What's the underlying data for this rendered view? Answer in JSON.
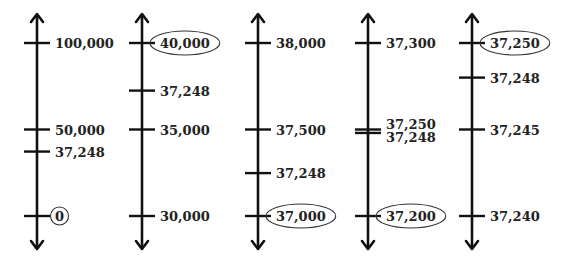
{
  "number_lines": [
    {
      "name": "line-1",
      "ticks": [
        {
          "label": "100,000",
          "value": 100000,
          "circled": false
        },
        {
          "label": "50,000",
          "value": 50000,
          "circled": false
        },
        {
          "label": "37,248",
          "value": 37248,
          "circled": false
        },
        {
          "label": "0",
          "value": 0,
          "circled": true
        }
      ]
    },
    {
      "name": "line-2",
      "ticks": [
        {
          "label": "40,000",
          "value": 40000,
          "circled": true
        },
        {
          "label": "37,248",
          "value": 37248,
          "circled": false
        },
        {
          "label": "35,000",
          "value": 35000,
          "circled": false
        },
        {
          "label": "30,000",
          "value": 30000,
          "circled": false
        }
      ]
    },
    {
      "name": "line-3",
      "ticks": [
        {
          "label": "38,000",
          "value": 38000,
          "circled": false
        },
        {
          "label": "37,500",
          "value": 37500,
          "circled": false
        },
        {
          "label": "37,248",
          "value": 37248,
          "circled": false
        },
        {
          "label": "37,000",
          "value": 37000,
          "circled": true
        }
      ]
    },
    {
      "name": "line-4",
      "ticks": [
        {
          "label": "37,300",
          "value": 37300,
          "circled": false
        },
        {
          "label": "37,250",
          "value": 37250,
          "circled": false
        },
        {
          "label": "37,248",
          "value": 37248,
          "circled": false
        },
        {
          "label": "37,200",
          "value": 37200,
          "circled": true
        }
      ]
    },
    {
      "name": "line-5",
      "ticks": [
        {
          "label": "37,250",
          "value": 37250,
          "circled": true
        },
        {
          "label": "37,248",
          "value": 37248,
          "circled": false
        },
        {
          "label": "37,245",
          "value": 37245,
          "circled": false
        },
        {
          "label": "37,240",
          "value": 37240,
          "circled": false
        }
      ]
    }
  ]
}
